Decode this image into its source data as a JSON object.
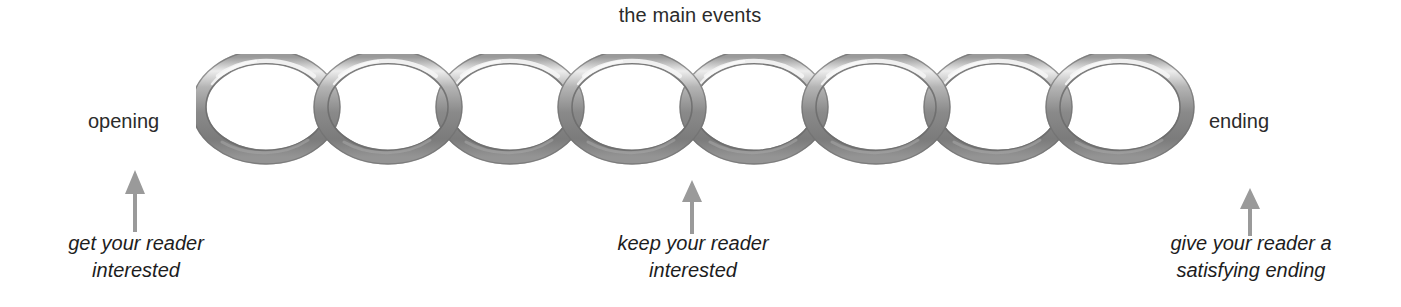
{
  "diagram": {
    "title": "the main events",
    "background_color": "#ffffff",
    "text_color": "#2b2b2b",
    "chain": {
      "link_count": 8,
      "metal_color_light": "#d8d8d8",
      "metal_color_mid": "#8d8d8d",
      "metal_color_dark": "#6d6d6d",
      "highlight_color": "#f2f2f2"
    },
    "endpoints": {
      "left_label": "opening",
      "right_label": "ending"
    },
    "annotations": [
      {
        "id": "opening-note",
        "line1": "get your reader",
        "line2": "interested"
      },
      {
        "id": "middle-note",
        "line1": "keep your reader",
        "line2": "interested"
      },
      {
        "id": "ending-note",
        "line1": "give your reader a",
        "line2": "satisfying ending"
      }
    ],
    "arrow_color": "#9a9a9a"
  }
}
